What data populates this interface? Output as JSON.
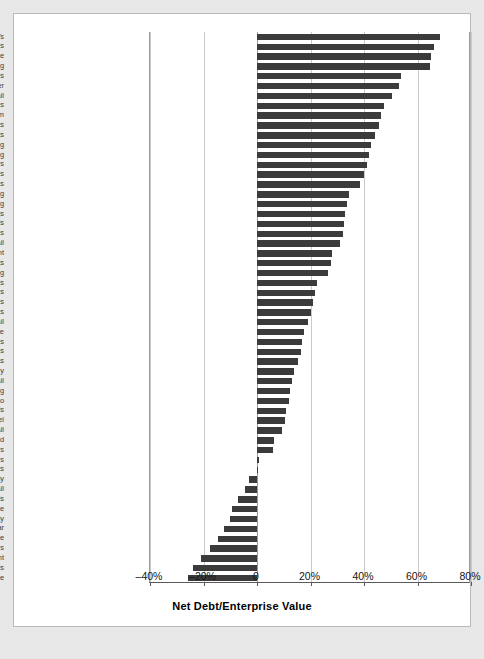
{
  "figure": {
    "background_color": "#ffffff",
    "page_background_color": "#e8e8e8",
    "bar_color": "#3b3b3b"
  },
  "axis": {
    "title": "Net Debt/Enterprise Value",
    "tick_labels": [
      "–40%",
      "–20%",
      "0",
      "20%",
      "40%",
      "60%",
      "80%"
    ],
    "tick_values": [
      -40,
      -20,
      0,
      20,
      40,
      60,
      80
    ]
  },
  "chart_data": {
    "type": "bar",
    "orientation": "horizontal",
    "title": "",
    "xlabel": "Net Debt/Enterprise Value",
    "ylabel": "",
    "xlim": [
      -40,
      80
    ],
    "xticks": [
      -40,
      -20,
      0,
      20,
      40,
      60,
      80
    ],
    "xtick_labels": [
      "–40%",
      "–20%",
      "0",
      "20%",
      "40%",
      "60%",
      "80%"
    ],
    "grid": true,
    "grid_axis": "x",
    "legend": null,
    "units": "percent",
    "categories": [
      "REITs",
      "Airlines",
      "Cable and Satellite",
      "Broadcasting",
      "Electric Utilities",
      "Tires and Rubber",
      "Automotive Retail",
      "Real Estate Services",
      "Wireless Telecomm",
      "Hotels and Resorts",
      "Paper Products",
      "Casinos and Gaming",
      "Oil and Gas Refining",
      "Automobile Manufacturers",
      "Department Stores",
      "Forest Products",
      "Homebuilding",
      "Advertising",
      "Home Furnishings",
      "Railroads",
      "Office Services and Supplies",
      "Food Retail",
      "Movies and Entertainment",
      "Restaurants",
      "Trucking",
      "Agricultural Products",
      "Soft Drinks",
      "All Industries",
      "Leisure Products",
      "Drug Retail",
      "Aerospace and Defense",
      "Industrial Conglomerates",
      "Healthcare Services",
      "Integrated Oil and Gas",
      "Industrial Machinery",
      "Home Improvement Retail",
      "Data Processing",
      "Tobacco",
      "Apparel and Luxury Goods",
      "Steel",
      "Electronics Retail",
      "Gold",
      "Brewers",
      "Hypermarkets/Super Centers",
      "Electronic Components",
      "Health Care Technology",
      "Internet Retail",
      "Pharmaceuticals",
      "Application Software",
      "Biotechnology",
      "Footwear",
      "Systems Software",
      "Semiconductors",
      "Communications Equipment",
      "Computer Peripherals",
      "Computer Hardware"
    ],
    "values": [
      68.5,
      66.0,
      65.2,
      64.8,
      54.0,
      53.0,
      50.5,
      47.5,
      46.5,
      45.5,
      44.0,
      42.5,
      41.8,
      41.0,
      40.0,
      38.5,
      34.5,
      33.5,
      33.0,
      32.5,
      32.0,
      31.0,
      28.0,
      27.5,
      26.5,
      22.5,
      21.5,
      21.0,
      20.0,
      19.0,
      17.5,
      17.0,
      16.5,
      15.5,
      14.0,
      13.0,
      12.5,
      12.0,
      11.0,
      10.5,
      9.5,
      6.5,
      6.0,
      0.8,
      0.3,
      -3.0,
      -4.5,
      -7.0,
      -9.5,
      -10.0,
      -12.5,
      -14.5,
      -17.5,
      -21.0,
      -24.0,
      -25.8
    ]
  }
}
